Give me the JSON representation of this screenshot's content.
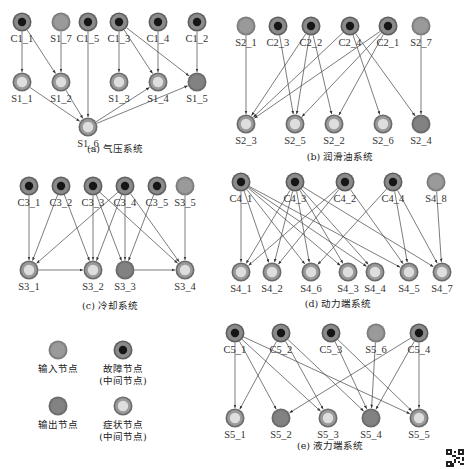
{
  "node_styles": {
    "input": {
      "outer": "#7d7d7d",
      "ring": "#8f8f8f",
      "core": "#9a9a9a",
      "core_r": 0
    },
    "fault": {
      "outer": "#5e5e5e",
      "ring": "#8a8a8a",
      "core": "#161616",
      "core_r": 4.2
    },
    "output": {
      "outer": "#6a6a6a",
      "ring": "#7c7c7c",
      "core": "#828282",
      "core_r": 0
    },
    "symptom": {
      "outer": "#6a6a6a",
      "ring": "#9a9a9a",
      "core": "#dedede",
      "core_r": 5.2
    }
  },
  "subgraphs": [
    {
      "id": "a",
      "caption": "(a) 气压系统",
      "caption_pos": [
        115,
        152
      ],
      "nodes": [
        {
          "id": "C1_1",
          "type": "fault",
          "x": 22,
          "y": 22
        },
        {
          "id": "S1_7",
          "type": "input",
          "x": 61,
          "y": 22
        },
        {
          "id": "C1_5",
          "type": "fault",
          "x": 88,
          "y": 22
        },
        {
          "id": "C1_3",
          "type": "fault",
          "x": 119,
          "y": 22
        },
        {
          "id": "C1_4",
          "type": "fault",
          "x": 158,
          "y": 22
        },
        {
          "id": "C1_2",
          "type": "fault",
          "x": 197,
          "y": 22
        },
        {
          "id": "S1_1",
          "type": "symptom",
          "x": 22,
          "y": 82
        },
        {
          "id": "S1_2",
          "type": "symptom",
          "x": 61,
          "y": 82
        },
        {
          "id": "S1_3",
          "type": "symptom",
          "x": 119,
          "y": 82
        },
        {
          "id": "S1_4",
          "type": "symptom",
          "x": 158,
          "y": 82
        },
        {
          "id": "S1_5",
          "type": "output",
          "x": 197,
          "y": 82
        },
        {
          "id": "S1_6",
          "type": "symptom",
          "x": 88,
          "y": 127
        }
      ],
      "edges": [
        [
          "C1_1",
          "S1_1"
        ],
        [
          "C1_1",
          "S1_2"
        ],
        [
          "S1_7",
          "S1_2"
        ],
        [
          "C1_5",
          "S1_6"
        ],
        [
          "C1_3",
          "S1_3"
        ],
        [
          "C1_3",
          "S1_4"
        ],
        [
          "C1_3",
          "S1_5"
        ],
        [
          "C1_4",
          "S1_4"
        ],
        [
          "C1_2",
          "S1_5"
        ],
        [
          "S1_1",
          "S1_6"
        ],
        [
          "S1_2",
          "S1_6"
        ],
        [
          "S1_6",
          "S1_4"
        ],
        [
          "S1_6",
          "S1_5"
        ]
      ]
    },
    {
      "id": "b",
      "caption": "(b) 润滑油系统",
      "caption_pos": [
        340,
        160
      ],
      "nodes": [
        {
          "id": "S2_1",
          "type": "input",
          "x": 246,
          "y": 26
        },
        {
          "id": "C2_3",
          "type": "fault",
          "x": 278,
          "y": 26
        },
        {
          "id": "C2_2",
          "type": "fault",
          "x": 311,
          "y": 26
        },
        {
          "id": "C2_4",
          "type": "fault",
          "x": 350,
          "y": 26
        },
        {
          "id": "C2_1",
          "type": "fault",
          "x": 388,
          "y": 26
        },
        {
          "id": "S2_7",
          "type": "input",
          "x": 421,
          "y": 26
        },
        {
          "id": "S2_3",
          "type": "symptom",
          "x": 246,
          "y": 124
        },
        {
          "id": "S2_5",
          "type": "symptom",
          "x": 295,
          "y": 124
        },
        {
          "id": "S2_2",
          "type": "symptom",
          "x": 334,
          "y": 124
        },
        {
          "id": "S2_6",
          "type": "symptom",
          "x": 383,
          "y": 124
        },
        {
          "id": "S2_4",
          "type": "output",
          "x": 421,
          "y": 124
        }
      ],
      "edges": [
        [
          "S2_1",
          "S2_3"
        ],
        [
          "C2_3",
          "S2_5"
        ],
        [
          "C2_2",
          "S2_3"
        ],
        [
          "C2_2",
          "S2_5"
        ],
        [
          "C2_2",
          "S2_2"
        ],
        [
          "C2_4",
          "S2_3"
        ],
        [
          "C2_4",
          "S2_6"
        ],
        [
          "C2_4",
          "S2_4"
        ],
        [
          "C2_1",
          "S2_3"
        ],
        [
          "C2_1",
          "S2_5"
        ],
        [
          "C2_1",
          "S2_2"
        ],
        [
          "S2_7",
          "S2_4"
        ]
      ]
    },
    {
      "id": "c",
      "caption": "(c) 冷却系统",
      "caption_pos": [
        110,
        309
      ],
      "nodes": [
        {
          "id": "C3_1",
          "type": "fault",
          "x": 29,
          "y": 186
        },
        {
          "id": "C3_2",
          "type": "fault",
          "x": 61,
          "y": 186
        },
        {
          "id": "C3_3",
          "type": "fault",
          "x": 93,
          "y": 186
        },
        {
          "id": "C3_4",
          "type": "fault",
          "x": 125,
          "y": 186
        },
        {
          "id": "C3_5",
          "type": "fault",
          "x": 157,
          "y": 186
        },
        {
          "id": "S3_5",
          "type": "input",
          "x": 185,
          "y": 186
        },
        {
          "id": "S3_1",
          "type": "symptom",
          "x": 29,
          "y": 270
        },
        {
          "id": "S3_2",
          "type": "symptom",
          "x": 93,
          "y": 270
        },
        {
          "id": "S3_3",
          "type": "output",
          "x": 125,
          "y": 270
        },
        {
          "id": "S3_4",
          "type": "symptom",
          "x": 185,
          "y": 270
        }
      ],
      "edges": [
        [
          "C3_1",
          "S3_1"
        ],
        [
          "C3_2",
          "S3_1"
        ],
        [
          "C3_2",
          "S3_2"
        ],
        [
          "C3_3",
          "S3_2"
        ],
        [
          "C3_3",
          "S3_3"
        ],
        [
          "C3_3",
          "S3_4"
        ],
        [
          "C3_4",
          "S3_1"
        ],
        [
          "C3_4",
          "S3_2"
        ],
        [
          "C3_4",
          "S3_3"
        ],
        [
          "C3_4",
          "S3_4"
        ],
        [
          "C3_5",
          "S3_3"
        ],
        [
          "S3_5",
          "S3_4"
        ],
        [
          "S3_1",
          "S3_2"
        ],
        [
          "S3_3",
          "S3_4"
        ]
      ]
    },
    {
      "id": "d",
      "caption": "(d) 动力端系统",
      "caption_pos": [
        338,
        307
      ],
      "nodes": [
        {
          "id": "C4_1",
          "type": "fault",
          "x": 241,
          "y": 182
        },
        {
          "id": "C4_3",
          "type": "fault",
          "x": 295,
          "y": 182
        },
        {
          "id": "C4_2",
          "type": "fault",
          "x": 345,
          "y": 182
        },
        {
          "id": "C4_4",
          "type": "fault",
          "x": 393,
          "y": 182
        },
        {
          "id": "S4_8",
          "type": "input",
          "x": 436,
          "y": 182
        },
        {
          "id": "S4_1",
          "type": "symptom",
          "x": 241,
          "y": 272
        },
        {
          "id": "S4_2",
          "type": "symptom",
          "x": 272,
          "y": 272
        },
        {
          "id": "S4_6",
          "type": "symptom",
          "x": 311,
          "y": 272
        },
        {
          "id": "S4_3",
          "type": "symptom",
          "x": 348,
          "y": 272
        },
        {
          "id": "S4_4",
          "type": "symptom",
          "x": 375,
          "y": 272
        },
        {
          "id": "S4_5",
          "type": "symptom",
          "x": 409,
          "y": 272
        },
        {
          "id": "S4_7",
          "type": "symptom",
          "x": 442,
          "y": 272
        }
      ],
      "edges": [
        [
          "C4_1",
          "S4_1"
        ],
        [
          "C4_1",
          "S4_2"
        ],
        [
          "C4_1",
          "S4_6"
        ],
        [
          "C4_1",
          "S4_3"
        ],
        [
          "C4_1",
          "S4_4"
        ],
        [
          "C4_1",
          "S4_5"
        ],
        [
          "C4_3",
          "S4_1"
        ],
        [
          "C4_3",
          "S4_2"
        ],
        [
          "C4_3",
          "S4_6"
        ],
        [
          "C4_3",
          "S4_3"
        ],
        [
          "C4_3",
          "S4_4"
        ],
        [
          "C4_3",
          "S4_7"
        ],
        [
          "C4_2",
          "S4_1"
        ],
        [
          "C4_2",
          "S4_2"
        ],
        [
          "C4_2",
          "S4_5"
        ],
        [
          "C4_4",
          "S4_6"
        ],
        [
          "C4_4",
          "S4_5"
        ],
        [
          "C4_4",
          "S4_7"
        ],
        [
          "S4_8",
          "S4_7"
        ]
      ]
    },
    {
      "id": "e",
      "caption": "(e) 液力端系统",
      "caption_pos": [
        330,
        449
      ],
      "nodes": [
        {
          "id": "C5_1",
          "type": "fault",
          "x": 235,
          "y": 333
        },
        {
          "id": "C5_2",
          "type": "fault",
          "x": 281,
          "y": 333
        },
        {
          "id": "C5_3",
          "type": "fault",
          "x": 331,
          "y": 333
        },
        {
          "id": "S5_6",
          "type": "input",
          "x": 376,
          "y": 333
        },
        {
          "id": "C5_4",
          "type": "fault",
          "x": 419,
          "y": 333
        },
        {
          "id": "S5_1",
          "type": "symptom",
          "x": 235,
          "y": 418
        },
        {
          "id": "S5_2",
          "type": "output",
          "x": 281,
          "y": 418
        },
        {
          "id": "S5_3",
          "type": "symptom",
          "x": 328,
          "y": 418
        },
        {
          "id": "S5_4",
          "type": "output",
          "x": 371,
          "y": 418
        },
        {
          "id": "S5_5",
          "type": "symptom",
          "x": 419,
          "y": 418
        }
      ],
      "edges": [
        [
          "C5_1",
          "S5_1"
        ],
        [
          "C5_1",
          "S5_2"
        ],
        [
          "C5_1",
          "S5_3"
        ],
        [
          "C5_1",
          "S5_5"
        ],
        [
          "C5_2",
          "S5_1"
        ],
        [
          "C5_2",
          "S5_3"
        ],
        [
          "C5_2",
          "S5_4"
        ],
        [
          "C5_3",
          "S5_4"
        ],
        [
          "C5_3",
          "S5_5"
        ],
        [
          "S5_6",
          "S5_4"
        ],
        [
          "C5_4",
          "S5_2"
        ],
        [
          "C5_4",
          "S5_4"
        ],
        [
          "C5_4",
          "S5_5"
        ]
      ]
    }
  ],
  "legend": {
    "items": [
      {
        "type": "input",
        "x": 58,
        "y": 350,
        "lines": [
          "输入节点"
        ]
      },
      {
        "type": "fault",
        "x": 123,
        "y": 350,
        "lines": [
          "故障节点",
          "(中间节点)"
        ]
      },
      {
        "type": "output",
        "x": 58,
        "y": 406,
        "lines": [
          "输出节点"
        ]
      },
      {
        "type": "symptom",
        "x": 123,
        "y": 406,
        "lines": [
          "症状节点",
          "(中间节点)"
        ]
      }
    ]
  }
}
